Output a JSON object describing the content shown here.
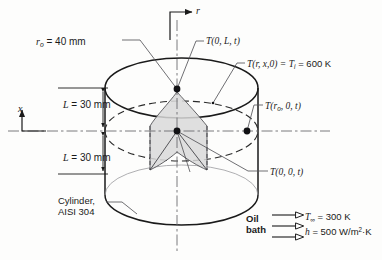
{
  "axes": {
    "radial_label": "r",
    "axial_label": "x"
  },
  "dimensions": {
    "radius_label": "r",
    "radius_sub": "o",
    "radius_value": "= 40 mm",
    "half_length_top": "= 30 mm",
    "half_length_bottom": "= 30 mm",
    "half_length_symbol": "L"
  },
  "temperatures": {
    "top_center": {
      "symbol": "T",
      "args": "(0, L, t)"
    },
    "initial": {
      "symbol": "T",
      "args": "(r, x,0) =",
      "sub_symbol": "T",
      "sub": "i",
      "value": "= 600 K"
    },
    "surface_radial": {
      "symbol": "T",
      "args_lead": "(r",
      "args_sub": "o",
      "args_tail": ", 0, t)"
    },
    "center": {
      "symbol": "T",
      "args": "(0, 0, t)"
    }
  },
  "material": {
    "line1": "Cylinder,",
    "line2": "AISI 304"
  },
  "environment": {
    "bath_line1": "Oil",
    "bath_line2": "bath",
    "t_inf_symbol": "T",
    "t_inf_sub": "∞",
    "t_inf_value": "= 300 K",
    "h_symbol": "h",
    "h_value": "= 500 W/m",
    "h_exp": "2",
    "h_unit_tail": "·K"
  },
  "colors": {
    "line": "#1a1a1a",
    "leader": "#55555a",
    "centerline": "#6b6b70",
    "shade_fill": "#d9d9d9",
    "background": "#fdfdfc"
  },
  "geometry": {
    "cylinder_left_x": 105,
    "cylinder_right_x": 258,
    "top_ellipse_cy": 88,
    "mid_ellipse_cy": 131,
    "bottom_ellipse_cy": 195,
    "ellipse_rx": 76.5,
    "ellipse_ry": 30,
    "center_x": 181,
    "points": [
      {
        "name": "top-center-node",
        "x": 177,
        "y": 89
      },
      {
        "name": "mid-center-node",
        "x": 177,
        "y": 131
      },
      {
        "name": "mid-surface-node",
        "x": 247,
        "y": 131
      }
    ]
  }
}
